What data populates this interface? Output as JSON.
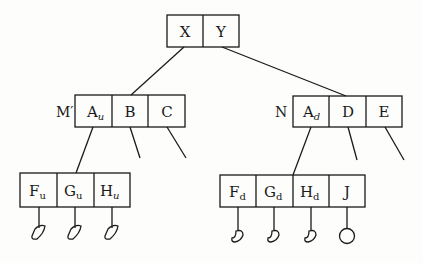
{
  "diagram": {
    "type": "tree",
    "root": {
      "cells": [
        {
          "main": "X",
          "sub": ""
        },
        {
          "main": "Y",
          "sub": ""
        }
      ]
    },
    "left_child": {
      "label": "M′",
      "cells": [
        {
          "main": "A",
          "sub": "u"
        },
        {
          "main": "B",
          "sub": ""
        },
        {
          "main": "C",
          "sub": ""
        }
      ]
    },
    "right_child": {
      "label": "N",
      "cells": [
        {
          "main": "A",
          "sub": "d"
        },
        {
          "main": "D",
          "sub": ""
        },
        {
          "main": "E",
          "sub": ""
        }
      ]
    },
    "left_grandchild": {
      "cells": [
        {
          "main": "F",
          "sub": "u"
        },
        {
          "main": "G",
          "sub": "u"
        },
        {
          "main": "H",
          "sub": "u"
        }
      ],
      "leaves": [
        "half-filled-leaf",
        "half-filled-leaf",
        "half-filled-leaf"
      ]
    },
    "right_grandchild": {
      "cells": [
        {
          "main": "F",
          "sub": "d"
        },
        {
          "main": "G",
          "sub": "d"
        },
        {
          "main": "H",
          "sub": "d"
        },
        {
          "main": "J",
          "sub": ""
        }
      ],
      "leaves": [
        "half-filled-leaf",
        "half-filled-leaf",
        "half-filled-leaf",
        "circle-leaf"
      ]
    },
    "colors": {
      "stroke": "#1a1a1a",
      "background": "#fdfdfb"
    }
  }
}
